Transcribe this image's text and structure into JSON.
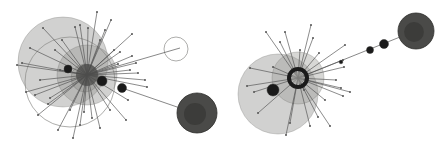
{
  "figure": {
    "background": "#ffffff",
    "colors": {
      "sphere_fill": "#9a9a96",
      "sphere_stroke": "#6e6e6a",
      "dark_sphere": "#4a4a48",
      "dark_core": "#2e2e2c",
      "spoke": "#555555",
      "node": "#1a1a1a",
      "ring": "#8a8a86"
    },
    "panels": [
      {
        "name": "left-cluster",
        "hub": {
          "x": 87,
          "y": 75
        },
        "spheres": [
          {
            "x": 63,
            "y": 62,
            "r": 45,
            "opacity": 0.45
          },
          {
            "x": 87,
            "y": 75,
            "r": 30,
            "opacity": 0.45
          },
          {
            "x": 85,
            "y": 78,
            "r": 14,
            "opacity": 0.6
          }
        ],
        "outline_circles": [
          {
            "x": 70,
            "y": 82,
            "r": 45
          },
          {
            "x": 176,
            "y": 49,
            "r": 12
          }
        ],
        "dark_nodes": [
          {
            "x": 68,
            "y": 69,
            "r": 4
          },
          {
            "x": 102,
            "y": 81,
            "r": 5
          },
          {
            "x": 122,
            "y": 88,
            "r": 4.5
          }
        ],
        "far_sphere": {
          "x": 197,
          "y": 113,
          "r": 20
        },
        "links": [
          {
            "x1": 87,
            "y1": 75,
            "x2": 180,
            "y2": 48
          },
          {
            "x1": 122,
            "y1": 88,
            "x2": 180,
            "y2": 108
          }
        ],
        "spokes": [
          [
            97,
            12
          ],
          [
            111,
            20
          ],
          [
            80,
            25
          ],
          [
            132,
            34
          ],
          [
            43,
            28
          ],
          [
            62,
            40
          ],
          [
            30,
            48
          ],
          [
            17,
            65
          ],
          [
            22,
            63
          ],
          [
            40,
            80
          ],
          [
            35,
            95
          ],
          [
            50,
            98
          ],
          [
            38,
            115
          ],
          [
            58,
            130
          ],
          [
            73,
            138
          ],
          [
            80,
            125
          ],
          [
            92,
            118
          ],
          [
            84,
            112
          ],
          [
            110,
            110
          ],
          [
            126,
            120
          ],
          [
            128,
            100
          ],
          [
            147,
            87
          ],
          [
            138,
            73
          ],
          [
            136,
            63
          ],
          [
            120,
            52
          ],
          [
            114,
            50
          ],
          [
            105,
            30
          ],
          [
            130,
            70
          ],
          [
            100,
            40
          ],
          [
            75,
            27
          ],
          [
            88,
            28
          ],
          [
            60,
            70
          ],
          [
            48,
            104
          ],
          [
            70,
            110
          ],
          [
            100,
            128
          ],
          [
            145,
            80
          ],
          [
            118,
            64
          ],
          [
            132,
            56
          ],
          [
            26,
            92
          ],
          [
            55,
            50
          ]
        ]
      },
      {
        "name": "right-cluster",
        "hub": {
          "x": 298,
          "y": 78
        },
        "spheres": [
          {
            "x": 278,
            "y": 94,
            "r": 40,
            "opacity": 0.45
          },
          {
            "x": 298,
            "y": 78,
            "r": 26,
            "opacity": 0.4
          }
        ],
        "ring": {
          "x": 298,
          "y": 78,
          "r": 9
        },
        "dark_nodes": [
          {
            "x": 273,
            "y": 90,
            "r": 6
          },
          {
            "x": 370,
            "y": 50,
            "r": 3.5
          },
          {
            "x": 384,
            "y": 44,
            "r": 4.5
          },
          {
            "x": 341,
            "y": 62,
            "r": 1.8
          }
        ],
        "far_sphere": {
          "x": 416,
          "y": 31,
          "r": 18
        },
        "links": [
          {
            "x1": 298,
            "y1": 78,
            "x2": 400,
            "y2": 37
          }
        ],
        "spokes": [
          [
            266,
            32
          ],
          [
            285,
            32
          ],
          [
            311,
            25
          ],
          [
            313,
            38
          ],
          [
            280,
            42
          ],
          [
            345,
            45
          ],
          [
            343,
            60
          ],
          [
            344,
            67
          ],
          [
            319,
            53
          ],
          [
            350,
            92
          ],
          [
            343,
            96
          ],
          [
            341,
            88
          ],
          [
            330,
            126
          ],
          [
            310,
            126
          ],
          [
            318,
            117
          ],
          [
            290,
            123
          ],
          [
            286,
            135
          ],
          [
            258,
            113
          ],
          [
            254,
            92
          ],
          [
            247,
            86
          ],
          [
            250,
            68
          ],
          [
            273,
            67
          ],
          [
            304,
            90
          ],
          [
            325,
            100
          ],
          [
            336,
            80
          ],
          [
            300,
            50
          ]
        ]
      }
    ]
  }
}
